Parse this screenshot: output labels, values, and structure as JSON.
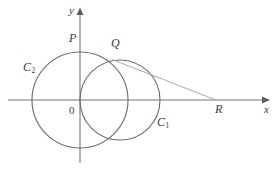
{
  "figure": {
    "type": "geometry-diagram",
    "title_visible": false,
    "background_color": "#ffffff",
    "stroke_color": "#6b6b6b",
    "axis_color": "#777777",
    "tangent_color": "#9a9a9a",
    "label_color": "#3a3a3a",
    "axes": {
      "x_label": "x",
      "y_label": "y",
      "origin_label": "0",
      "x_axis_y": 100,
      "y_axis_x": 80,
      "x_axis_start": 8,
      "x_axis_end": 268,
      "y_axis_top": 9,
      "y_axis_bottom": 163
    },
    "circles": [
      {
        "name": "C_1",
        "label": "C",
        "subscript": "1",
        "cx": 120,
        "cy": 100,
        "r": 40,
        "label_x": 158,
        "label_y": 117
      },
      {
        "name": "C_2",
        "label": "C",
        "subscript": "2",
        "cx": 80,
        "cy": 100,
        "r": 48,
        "label_x": 24,
        "label_y": 62
      }
    ],
    "points": [
      {
        "name": "P",
        "label": "P",
        "x": 80,
        "y": 52,
        "label_x": 70,
        "label_y": 33
      },
      {
        "name": "Q",
        "label": "Q",
        "x": 113,
        "y": 61,
        "label_x": 112,
        "label_y": 38
      },
      {
        "name": "R",
        "label": "R",
        "x": 215,
        "y": 100,
        "label_x": 216,
        "label_y": 104
      }
    ],
    "segments": [
      {
        "name": "tangent-QR",
        "x1": 113,
        "y1": 60,
        "x2": 215,
        "y2": 100
      }
    ]
  }
}
